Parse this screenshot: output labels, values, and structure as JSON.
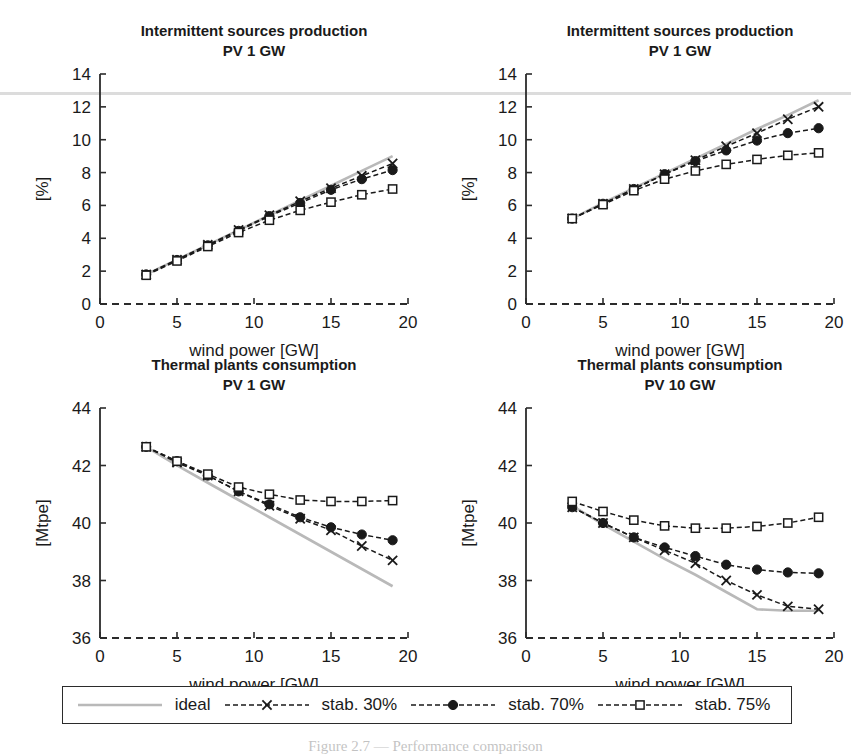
{
  "figure": {
    "caption": "Figure 2.7 — Performance comparison",
    "axis_color": "#2b2b2b",
    "ideal_color": "#b9b9b9",
    "series_color": "#1a1a1a",
    "scan_artifact_y": 92
  },
  "axis_labels": {
    "x": "wind power [GW]",
    "y_percent": "[%]",
    "y_mtpe": "[Mtpe]"
  },
  "legend": {
    "items": [
      {
        "label": "ideal",
        "marker": "none",
        "color": "#b9b9b9"
      },
      {
        "label": "stab. 30%",
        "marker": "cross",
        "color": "#1a1a1a"
      },
      {
        "label": "stab. 70%",
        "marker": "circle",
        "color": "#1a1a1a"
      },
      {
        "label": "stab. 75%",
        "marker": "square",
        "color": "#1a1a1a"
      }
    ]
  },
  "chart_data": [
    {
      "id": "top-left",
      "type": "line",
      "title": "Intermittent sources production",
      "subtitle": "PV 1 GW",
      "xlabel": "wind power [GW]",
      "ylabel": "[%]",
      "xlim": [
        0,
        20
      ],
      "ylim": [
        0,
        14
      ],
      "xticks": [
        0,
        5,
        10,
        15,
        20
      ],
      "yticks": [
        0,
        2,
        4,
        6,
        8,
        10,
        12,
        14
      ],
      "grid": false,
      "x": [
        3,
        5,
        7,
        9,
        11,
        13,
        15,
        17,
        19
      ],
      "series": [
        {
          "name": "ideal",
          "marker": "none",
          "values": [
            1.8,
            2.7,
            3.6,
            4.5,
            5.4,
            6.3,
            7.2,
            8.1,
            9.0
          ]
        },
        {
          "name": "stab. 30%",
          "marker": "cross",
          "values": [
            1.8,
            2.7,
            3.6,
            4.5,
            5.4,
            6.25,
            7.05,
            7.8,
            8.55
          ]
        },
        {
          "name": "stab. 70%",
          "marker": "circle",
          "values": [
            1.8,
            2.68,
            3.57,
            4.45,
            5.35,
            6.15,
            6.95,
            7.6,
            8.15
          ]
        },
        {
          "name": "stab. 75%",
          "marker": "square",
          "values": [
            1.75,
            2.62,
            3.5,
            4.35,
            5.1,
            5.7,
            6.2,
            6.65,
            7.0
          ]
        }
      ]
    },
    {
      "id": "top-right",
      "type": "line",
      "title": "Intermittent sources production",
      "subtitle": "PV 1 GW",
      "xlabel": "wind power [GW]",
      "ylabel": "[%]",
      "xlim": [
        0,
        20
      ],
      "ylim": [
        0,
        14
      ],
      "xticks": [
        0,
        5,
        10,
        15,
        20
      ],
      "yticks": [
        0,
        2,
        4,
        6,
        8,
        10,
        12,
        14
      ],
      "grid": false,
      "x": [
        3,
        5,
        7,
        9,
        11,
        13,
        15,
        17,
        19
      ],
      "series": [
        {
          "name": "ideal",
          "marker": "none",
          "values": [
            5.2,
            6.15,
            7.05,
            7.95,
            8.85,
            9.75,
            10.65,
            11.5,
            12.4
          ]
        },
        {
          "name": "stab. 30%",
          "marker": "cross",
          "values": [
            5.2,
            6.1,
            7.0,
            7.9,
            8.75,
            9.6,
            10.4,
            11.25,
            12.0
          ]
        },
        {
          "name": "stab. 70%",
          "marker": "circle",
          "values": [
            5.2,
            6.1,
            7.0,
            7.9,
            8.7,
            9.35,
            9.95,
            10.4,
            10.7
          ]
        },
        {
          "name": "stab. 75%",
          "marker": "square",
          "values": [
            5.2,
            6.05,
            6.9,
            7.6,
            8.1,
            8.5,
            8.8,
            9.05,
            9.2
          ]
        }
      ]
    },
    {
      "id": "bottom-left",
      "type": "line",
      "title": "Thermal plants consumption",
      "subtitle": "PV 1 GW",
      "xlabel": "wind power [GW]",
      "ylabel": "[Mtpe]",
      "xlim": [
        0,
        20
      ],
      "ylim": [
        36,
        44
      ],
      "xticks": [
        0,
        5,
        10,
        15,
        20
      ],
      "yticks": [
        36,
        38,
        40,
        42,
        44
      ],
      "grid": false,
      "x": [
        3,
        5,
        7,
        9,
        11,
        13,
        15,
        17,
        19
      ],
      "series": [
        {
          "name": "ideal",
          "marker": "none",
          "values": [
            42.65,
            42.0,
            41.4,
            40.8,
            40.2,
            39.6,
            39.0,
            38.4,
            37.8
          ]
        },
        {
          "name": "stab. 30%",
          "marker": "cross",
          "values": [
            42.65,
            42.1,
            41.65,
            41.1,
            40.6,
            40.15,
            39.75,
            39.2,
            38.7
          ]
        },
        {
          "name": "stab. 70%",
          "marker": "circle",
          "values": [
            42.65,
            42.15,
            41.65,
            41.1,
            40.65,
            40.2,
            39.85,
            39.6,
            39.4
          ]
        },
        {
          "name": "stab. 75%",
          "marker": "square",
          "values": [
            42.65,
            42.15,
            41.7,
            41.25,
            41.0,
            40.8,
            40.75,
            40.75,
            40.78
          ]
        }
      ]
    },
    {
      "id": "bottom-right",
      "type": "line",
      "title": "Thermal plants consumption",
      "subtitle": "PV 10 GW",
      "xlabel": "wind power [GW]",
      "ylabel": "[Mtpe]",
      "xlim": [
        36,
        44
      ],
      "ylim": [
        36,
        44
      ],
      "xticks": [
        0,
        5,
        10,
        15,
        20
      ],
      "yticks": [
        36,
        38,
        40,
        42,
        44
      ],
      "grid": false,
      "x": [
        3,
        5,
        7,
        9,
        11,
        13,
        15,
        17,
        19
      ],
      "series": [
        {
          "name": "ideal",
          "marker": "none",
          "values": [
            40.6,
            39.95,
            39.35,
            38.75,
            38.2,
            37.6,
            37.0,
            36.95,
            36.95
          ]
        },
        {
          "name": "stab. 30%",
          "marker": "cross",
          "values": [
            40.55,
            40.0,
            39.5,
            39.05,
            38.6,
            38.0,
            37.5,
            37.1,
            37.0
          ]
        },
        {
          "name": "stab. 70%",
          "marker": "circle",
          "values": [
            40.55,
            40.0,
            39.5,
            39.15,
            38.85,
            38.55,
            38.38,
            38.28,
            38.25
          ]
        },
        {
          "name": "stab. 75%",
          "marker": "square",
          "values": [
            40.75,
            40.4,
            40.1,
            39.9,
            39.82,
            39.82,
            39.88,
            40.0,
            40.2
          ]
        }
      ]
    }
  ]
}
